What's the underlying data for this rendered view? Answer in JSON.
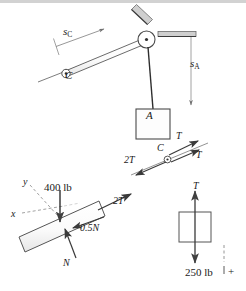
{
  "figure": {
    "background_color": "#ffffff",
    "stroke_color": "#404040",
    "text_color": "#1a1a1a",
    "width": 246,
    "height": 291
  },
  "main_diagram": {
    "name": "pulley-system",
    "labels": {
      "s_C": "s",
      "s_C_sub": "C",
      "s_A": "s",
      "s_A_sub": "A",
      "pulley_C": "C",
      "block_A": "A"
    }
  },
  "fbd_pulley": {
    "name": "free-body-diagram-pulley-C",
    "labels": {
      "pulley": "C",
      "tension_upper": "T",
      "tension_lower": "T",
      "resultant": "2T"
    }
  },
  "fbd_rod": {
    "name": "free-body-diagram-rod",
    "labels": {
      "axis_y": "y",
      "axis_x": "x",
      "weight": "400 lb",
      "tension": "2T",
      "friction": "0.5N",
      "normal": "N"
    }
  },
  "fbd_block": {
    "name": "free-body-diagram-block-A",
    "labels": {
      "tension": "T",
      "weight": "250 lb",
      "sign_convention": "+"
    }
  }
}
